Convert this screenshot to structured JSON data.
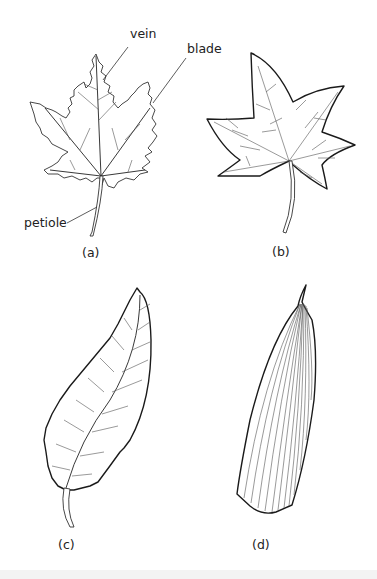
{
  "figure": {
    "labels": {
      "vein": "vein",
      "blade": "blade",
      "petiole": "petiole"
    },
    "panels": [
      {
        "id": "a",
        "caption": "(a)",
        "description": "maple-like palmately lobed leaf with serrated margin"
      },
      {
        "id": "b",
        "caption": "(b)",
        "description": "star-shaped palmate leaf with smooth margin and netted veins"
      },
      {
        "id": "c",
        "caption": "(c)",
        "description": "elliptic serrated leaf with pinnate venation"
      },
      {
        "id": "d",
        "caption": "(d)",
        "description": "narrow leaf with parallel venation"
      }
    ]
  }
}
